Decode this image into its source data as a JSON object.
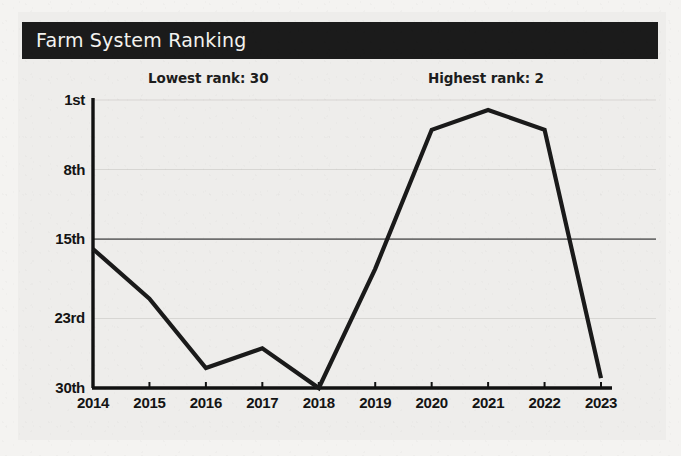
{
  "title": "Farm System Ranking",
  "annotations": {
    "lowest": "Lowest rank: 30",
    "highest": "Highest rank: 2"
  },
  "colors": {
    "title_bar": "#1b1b1b",
    "title_text": "#f3f2ef",
    "panel_background": "#eeedeb",
    "page_background": "#f4f3f1",
    "line": "#1a1a1a",
    "axis": "#111111",
    "gridline": "#d7d6d3",
    "gridline_emphasis": "#6e6e6e"
  },
  "chart_data": {
    "type": "line",
    "title": "Farm System Ranking",
    "xlabel": "",
    "ylabel": "",
    "x": [
      2014,
      2015,
      2016,
      2017,
      2018,
      2019,
      2020,
      2021,
      2022,
      2023
    ],
    "categories": [
      "2014",
      "2015",
      "2016",
      "2017",
      "2018",
      "2019",
      "2020",
      "2021",
      "2022",
      "2023"
    ],
    "values": [
      16,
      21,
      28,
      26,
      30,
      18,
      4,
      2,
      4,
      29
    ],
    "series": [
      {
        "name": "Farm System Ranking",
        "values": [
          16,
          21,
          28,
          26,
          30,
          18,
          4,
          2,
          4,
          29
        ]
      }
    ],
    "ylim": [
      1,
      30
    ],
    "y_inverted": true,
    "ytick_values": [
      1,
      8,
      15,
      23,
      30
    ],
    "ytick_labels": [
      "1st",
      "8th",
      "15th",
      "23rd",
      "30th"
    ],
    "xtick_labels": [
      "2014",
      "2015",
      "2016",
      "2017",
      "2018",
      "2019",
      "2020",
      "2021",
      "2022",
      "2023"
    ],
    "grid": true,
    "emphasized_gridline": 15,
    "legend": "none",
    "annotations": [
      {
        "text": "Lowest rank: 30",
        "value": 30,
        "at_year": 2018
      },
      {
        "text": "Highest rank: 2",
        "value": 2,
        "at_year": 2021
      }
    ]
  }
}
